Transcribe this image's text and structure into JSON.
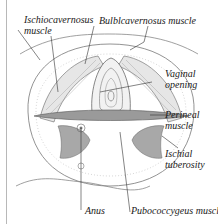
{
  "figure": {
    "labels": {
      "ischiocavernosus": [
        "Ischiocavernosus",
        "muscle"
      ],
      "bulbocavernosus": "Bulblcavernosus muscle",
      "vaginal_opening": [
        "Vaginal",
        "opening"
      ],
      "perineal_muscle": [
        "Perineal",
        "muscle"
      ],
      "ischial_tuberosity": [
        "Ischial",
        "tuberosity"
      ],
      "anus": "Anus",
      "pubococcygeus": "Pubococcygeus muscle"
    },
    "colors": {
      "ink": "#1a1a1a",
      "line": "#555555",
      "shade": "#9a9a9a",
      "frame": "#b8b8b8"
    }
  }
}
